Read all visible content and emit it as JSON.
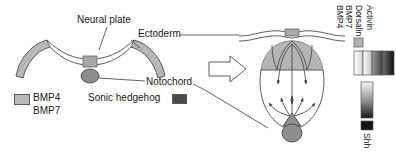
{
  "figure": {
    "labels": {
      "neural_plate": "Neural plate",
      "ectoderm": "Ectoderm",
      "notochord": "Notochord",
      "sonic_hedgehog": "Sonic hedgehog"
    },
    "key": {
      "bmp4": "BMP4",
      "bmp7": "BMP7"
    },
    "transition_arrow": "right-arrow"
  },
  "legend_top": {
    "labels": [
      "BMP4",
      "BMP7",
      "Dorsalin",
      "Activin"
    ],
    "swatch_label": "BMP4",
    "bands": [
      {
        "name": "BMP4",
        "from": "#ffffff",
        "to": "#cfcfcf"
      },
      {
        "name": "BMP7",
        "from": "#ffffff",
        "to": "#bdbdbd"
      },
      {
        "name": "Dorsalin",
        "from": "#9a9a9a",
        "to": "#3a3a3a"
      },
      {
        "name": "Activin",
        "from": "#6a6a6a",
        "to": "#111111"
      }
    ]
  },
  "legend_bottom": {
    "label": "Shh",
    "gradient_from": "#f2f2f2",
    "gradient_to": "#1a1a1a",
    "swatch_color": "#141414"
  },
  "colors": {
    "ectoderm_fill": "#b4b4b4",
    "roof_plate_fill": "#a8a8a8",
    "notochord_fill": "#9a9a9a",
    "floor_plate_fill": "#8e8e8e",
    "tube_fill": "#ffffff",
    "outline": "#4a4a4a",
    "text": "#1a1a1a"
  }
}
